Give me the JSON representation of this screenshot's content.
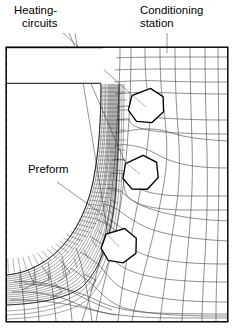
{
  "figure": {
    "type": "fem-mesh-diagram",
    "canvas": {
      "width": 238,
      "height": 329
    },
    "background_color": "#ffffff",
    "line_color": "#4a4a4a",
    "frame_color": "#000000",
    "hole_color": "#000000"
  },
  "labels": [
    {
      "id": "heating-circuits",
      "line1": "Heating-",
      "line2": "circuits",
      "x": 14,
      "y": 14,
      "leader_targets": "three heptagonal holes"
    },
    {
      "id": "conditioning-station",
      "line1": "Conditioning",
      "line2": "station",
      "x": 140,
      "y": 14,
      "leader_targets": "mesh body top edge"
    },
    {
      "id": "preform",
      "line1": "Preform",
      "line2": "",
      "x": 28,
      "y": 170,
      "leader_targets": "dense curved boundary layer band"
    }
  ],
  "holes": [
    {
      "name": "heating-circuit-1",
      "cx": 146,
      "cy": 106,
      "r": 18,
      "sides": 7,
      "rotation": 14
    },
    {
      "name": "heating-circuit-2",
      "cx": 140,
      "cy": 173,
      "r": 18,
      "sides": 7,
      "rotation": 8
    },
    {
      "name": "heating-circuit-3",
      "cx": 119,
      "cy": 246,
      "r": 18,
      "sides": 7,
      "rotation": 20
    }
  ],
  "frame": {
    "x": 6,
    "y": 47,
    "width": 222,
    "height": 275
  },
  "cavity_block": {
    "x": 6,
    "y": 47,
    "width": 96,
    "height": 37,
    "description": "empty mold cavity region"
  },
  "symmetry_axis": {
    "x": 6,
    "y1": 47,
    "y2": 322,
    "style": "dashed"
  },
  "preform_band": {
    "description": "dense fine-mesh boundary layer curving from top vertical wall around the corner to the bottom horizontal wall",
    "layers": 14
  }
}
